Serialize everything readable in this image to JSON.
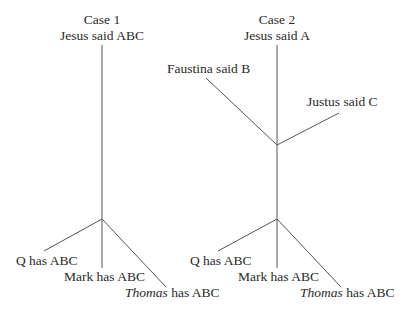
{
  "case1": {
    "title": "Case 1",
    "source": "Jesus said ABC",
    "outputs": {
      "q": "Q has ABC",
      "mark": "Mark has ABC",
      "thomas_italic": "Thomas",
      "thomas_rest": " has ABC"
    }
  },
  "case2": {
    "title": "Case 2",
    "source": "Jesus said A",
    "branch_left": "Faustina said B",
    "branch_right": "Justus said C",
    "outputs": {
      "q": "Q has ABC",
      "mark": "Mark has ABC",
      "thomas_italic": "Thomas",
      "thomas_rest": " has ABC"
    }
  },
  "colors": {
    "line": "#555555",
    "text": "#2a2a2a"
  }
}
